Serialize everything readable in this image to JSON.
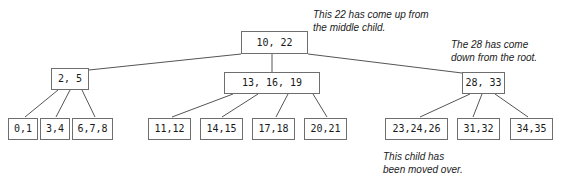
{
  "diagram": {
    "colors": {
      "background": "#ffffff",
      "node_border": "#6e6e6e",
      "node_fill": "#ffffff",
      "edge": "#555555",
      "text": "#1a1a1a"
    },
    "root": {
      "label": "10, 22",
      "x": 241,
      "y": 31,
      "w": 67,
      "h": 23
    },
    "internal_nodes": [
      {
        "name": "internal-node-left",
        "label": "2, 5",
        "x": 51,
        "y": 68,
        "w": 38,
        "h": 22
      },
      {
        "name": "internal-node-middle",
        "label": "13, 16, 19",
        "x": 224,
        "y": 72,
        "w": 96,
        "h": 22
      },
      {
        "name": "internal-node-right",
        "label": "28, 33",
        "x": 462,
        "y": 72,
        "w": 43,
        "h": 22
      }
    ],
    "leaf_nodes": [
      {
        "name": "leaf-node-0-1",
        "label": "0,1",
        "x": 8,
        "y": 118,
        "w": 30,
        "h": 22
      },
      {
        "name": "leaf-node-3-4",
        "label": "3,4",
        "x": 40,
        "y": 118,
        "w": 30,
        "h": 22
      },
      {
        "name": "leaf-node-6-7-8",
        "label": "6,7,8",
        "x": 72,
        "y": 118,
        "w": 41,
        "h": 22
      },
      {
        "name": "leaf-node-11-12",
        "label": "11,12",
        "x": 148,
        "y": 118,
        "w": 43,
        "h": 22
      },
      {
        "name": "leaf-node-14-15",
        "label": "14,15",
        "x": 200,
        "y": 118,
        "w": 43,
        "h": 22
      },
      {
        "name": "leaf-node-17-18",
        "label": "17,18",
        "x": 252,
        "y": 118,
        "w": 43,
        "h": 22
      },
      {
        "name": "leaf-node-20-21",
        "label": "20,21",
        "x": 304,
        "y": 118,
        "w": 43,
        "h": 22
      },
      {
        "name": "leaf-node-23-24-26",
        "label": "23,24,26",
        "x": 385,
        "y": 118,
        "w": 63,
        "h": 22
      },
      {
        "name": "leaf-node-31-32",
        "label": "31,32",
        "x": 457,
        "y": 118,
        "w": 43,
        "h": 22
      },
      {
        "name": "leaf-node-34-35",
        "label": "34,35",
        "x": 510,
        "y": 118,
        "w": 43,
        "h": 22
      }
    ],
    "edges": [
      {
        "name": "edge-root-to-left",
        "x1": 241,
        "y1": 54,
        "x2": 89,
        "y2": 70
      },
      {
        "name": "edge-root-to-middle",
        "x1": 272,
        "y1": 54,
        "x2": 272,
        "y2": 72
      },
      {
        "name": "edge-root-to-right",
        "x1": 308,
        "y1": 54,
        "x2": 462,
        "y2": 73
      },
      {
        "name": "edge-left-to-leaf-0-1",
        "x1": 58,
        "y1": 90,
        "x2": 25,
        "y2": 117
      },
      {
        "name": "edge-left-to-leaf-3-4",
        "x1": 70,
        "y1": 90,
        "x2": 56,
        "y2": 117
      },
      {
        "name": "edge-left-to-leaf-6-7-8",
        "x1": 82,
        "y1": 90,
        "x2": 95,
        "y2": 117
      },
      {
        "name": "edge-middle-to-leaf-11-12",
        "x1": 233,
        "y1": 94,
        "x2": 172,
        "y2": 117
      },
      {
        "name": "edge-middle-to-leaf-14-15",
        "x1": 258,
        "y1": 94,
        "x2": 222,
        "y2": 117
      },
      {
        "name": "edge-middle-to-leaf-17-18",
        "x1": 288,
        "y1": 94,
        "x2": 276,
        "y2": 117
      },
      {
        "name": "edge-middle-to-leaf-20-21",
        "x1": 313,
        "y1": 94,
        "x2": 327,
        "y2": 117
      },
      {
        "name": "edge-right-to-leaf-23-24-26",
        "x1": 470,
        "y1": 94,
        "x2": 420,
        "y2": 117
      },
      {
        "name": "edge-right-to-leaf-31-32",
        "x1": 482,
        "y1": 94,
        "x2": 473,
        "y2": 117
      },
      {
        "name": "edge-right-to-leaf-34-35",
        "x1": 495,
        "y1": 94,
        "x2": 528,
        "y2": 117
      }
    ],
    "annotations": [
      {
        "name": "annotation-promoted-key",
        "text": "This 22 has come up from\nthe middle child.",
        "x": 313,
        "y": 8
      },
      {
        "name": "annotation-demoted-key",
        "text": "The 28 has come\ndown from the root.",
        "x": 451,
        "y": 38
      },
      {
        "name": "annotation-moved-child",
        "text": "This child has\nbeen moved over.",
        "x": 383,
        "y": 150
      }
    ]
  }
}
